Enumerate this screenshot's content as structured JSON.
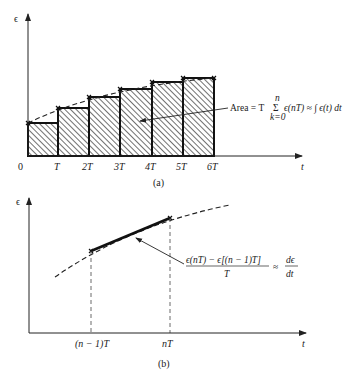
{
  "panel_a": {
    "y_label": "ϵ",
    "x_label": "t",
    "origin_label": "0",
    "ticks": [
      "T",
      "2T",
      "3T",
      "4T",
      "5T",
      "6T"
    ],
    "caption": "(a)",
    "annotation": {
      "prefix": "Area = T",
      "sum_symbol": "Σ",
      "sum_upper": "n",
      "sum_lower": "k=0",
      "body": "ϵ(nT) ≈ ∫ ϵ(t) dt"
    },
    "bar_heights_px": [
      33,
      48,
      59,
      67,
      74,
      78
    ]
  },
  "panel_b": {
    "y_label": "ϵ",
    "x_label": "t",
    "ticks": [
      "(n − 1)T",
      "nT"
    ],
    "caption": "(b)",
    "annotation": {
      "numerator": "ϵ(nT) − ϵ[(n − 1)T]",
      "denominator": "T",
      "approx": "≈",
      "rhs_numerator": "dϵ",
      "rhs_denominator": "dt"
    }
  },
  "colors": {
    "ink": "#222222",
    "background": "#ffffff"
  }
}
